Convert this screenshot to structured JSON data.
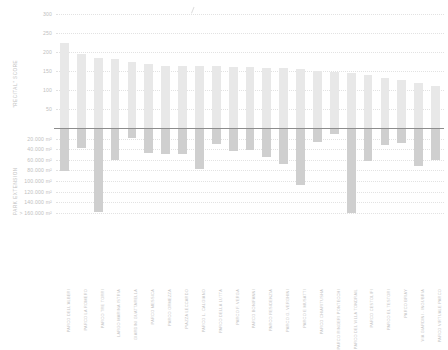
{
  "chart_data": {
    "type": "bar",
    "title": "",
    "subtitle": "",
    "orientation": "vertical-diverging",
    "grid": true,
    "legend_position": "none",
    "xlabel": "",
    "upper_axis": {
      "label": "\"RECITAL\" SCORE",
      "ticks": [
        300,
        250,
        200,
        150,
        100,
        50
      ],
      "tick_labels": [
        "300",
        "250",
        "200",
        "150",
        "100",
        "50"
      ],
      "ylim": [
        0,
        310
      ]
    },
    "lower_axis": {
      "label": "PARK EXTENSION",
      "ticks": [
        20000,
        40000,
        60000,
        80000,
        100000,
        120000,
        140000,
        160000
      ],
      "tick_labels": [
        "20.000 m²",
        "40.000 m²",
        "60.000 m²",
        "80.000 m²",
        "100.000 m²",
        "120.000 m²",
        "140.000 m²",
        "> 160.000 m²"
      ],
      "ylim": [
        0,
        170000
      ]
    },
    "categories": [
      "PARCO DELL'ALBERI",
      "PARCO LA ROMERO",
      "PARCO TRE TORRI",
      "LARGO MARINA ISTRIA",
      "GIARDINI GUATTARELLA",
      "PARCO MESSICA",
      "PARCO ORMEZZA",
      "PIAZZA LECCARDO",
      "PARCO L. CALGIANO",
      "PARCO DELLA LUTTA",
      "PARCO F. VERGA",
      "PARCO BONIFANNI",
      "PARCO RESIDENZIA",
      "PARCO G. VERGHINI",
      "PARCO E MUSATTI",
      "PARCO CHIARITUSHA",
      "PARCO RINGERI PONTECCHI",
      "PARCO DEL VILLA TONDRAIL",
      "PARCO CESTOLIFI",
      "PARCO EL TESTORI",
      "PARCO BRIAY",
      "VIA GIARDINI - INGUBRIA",
      "PARCO VIRTUALE PARCO"
    ],
    "series": [
      {
        "name": "\"Recital\" score",
        "direction": "up",
        "color": "#e8e8e8",
        "values": [
          222,
          194,
          184,
          180,
          174,
          168,
          164,
          164,
          163,
          162,
          160,
          159,
          158,
          157,
          156,
          150,
          148,
          144,
          140,
          132,
          126,
          118,
          110
        ]
      },
      {
        "name": "Park extension",
        "direction": "down",
        "color": "#cfcfcf",
        "values": [
          82000,
          38000,
          158000,
          60000,
          18000,
          47000,
          50000,
          49000,
          78000,
          30000,
          44000,
          41000,
          55000,
          68000,
          108000,
          26000,
          12000,
          160000,
          62000,
          33000,
          28000,
          72000,
          60000
        ]
      }
    ]
  },
  "colors": {
    "bar_up": "#e8e8e8",
    "bar_down": "#cfcfcf",
    "zero_line": "#8d8d8d",
    "grid": "#e2e2e2",
    "text": "#c0c0c0",
    "background": "#ffffff"
  }
}
